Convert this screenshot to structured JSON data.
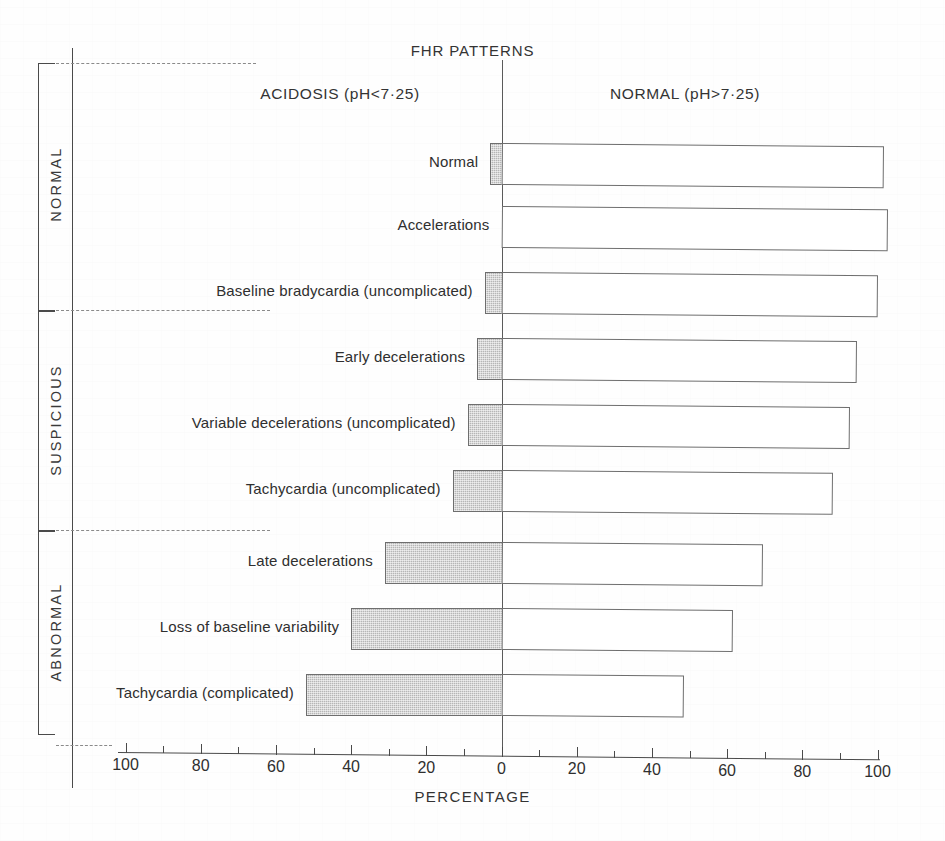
{
  "figure": {
    "title": "FHR PATTERNS",
    "left_header": "ACIDOSIS (pH<7·25)",
    "right_header": "NORMAL (pH>7·25)",
    "xaxis_title": "PERCENTAGE"
  },
  "groups": [
    {
      "label": "NORMAL"
    },
    {
      "label": "SUSPICIOUS"
    },
    {
      "label": "ABNORMAL"
    }
  ],
  "axis": {
    "tick_labels": [
      "100",
      "80",
      "60",
      "40",
      "20",
      "0",
      "20",
      "40",
      "60",
      "80",
      "100"
    ],
    "tick_values": [
      -100,
      -80,
      -60,
      -40,
      -20,
      0,
      20,
      40,
      60,
      80,
      100
    ]
  },
  "chart_data": {
    "type": "bar",
    "orientation": "horizontal",
    "style": "diverging-bidirectional",
    "title": "FHR PATTERNS",
    "xlabel": "PERCENTAGE",
    "ylabel": "",
    "xlim": [
      -100,
      100
    ],
    "grid": false,
    "legend": "none",
    "series": [
      {
        "name": "ACIDOSIS (pH<7·25)",
        "direction": "left",
        "fill": "hatched-grey",
        "values": [
          3,
          0,
          4.5,
          6.5,
          9,
          13,
          31,
          40,
          52
        ]
      },
      {
        "name": "NORMAL (pH>7·25)",
        "direction": "right",
        "fill": "white",
        "values": [
          101,
          102,
          99.5,
          94,
          92,
          87.5,
          69,
          61,
          48
        ]
      }
    ],
    "categories": [
      "Normal",
      "Accelerations",
      "Baseline bradycardia (uncomplicated)",
      "Early decelerations",
      "Variable decelerations (uncomplicated)",
      "Tachycardia (uncomplicated)",
      "Late decelerations",
      "Loss of baseline variability",
      "Tachycardia (complicated)"
    ],
    "category_groups": [
      "NORMAL",
      "NORMAL",
      "NORMAL",
      "SUSPICIOUS",
      "SUSPICIOUS",
      "SUSPICIOUS",
      "ABNORMAL",
      "ABNORMAL",
      "ABNORMAL"
    ],
    "annotations": [
      "ACIDOSIS (pH<7·25)",
      "NORMAL (pH>7·25)"
    ]
  },
  "colors": {
    "acidosis_fill": "#b6b6b6",
    "normal_fill": "#ffffff",
    "stroke": "#6e6e6e",
    "axis": "#4a4a4a",
    "text": "#2f2f2f"
  }
}
